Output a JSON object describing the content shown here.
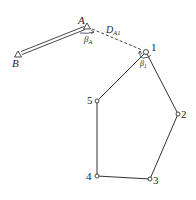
{
  "diagram": {
    "type": "traverse-survey-connection",
    "points": {
      "A": {
        "label": "A",
        "x": 87,
        "y": 27,
        "kind": "control"
      },
      "B": {
        "label": "B",
        "x": 18,
        "y": 54,
        "kind": "control"
      },
      "P1": {
        "label": "1",
        "x": 146,
        "y": 52,
        "kind": "traverse"
      },
      "P2": {
        "label": "2",
        "x": 178,
        "y": 114,
        "kind": "traverse"
      },
      "P3": {
        "label": "3",
        "x": 150,
        "y": 179,
        "kind": "traverse"
      },
      "P4": {
        "label": "4",
        "x": 97,
        "y": 176,
        "kind": "traverse"
      },
      "P5": {
        "label": "5",
        "x": 97,
        "y": 101,
        "kind": "traverse"
      }
    },
    "labels": {
      "A": "A",
      "B": "B",
      "p1": "1",
      "p2": "2",
      "p3": "3",
      "p4": "4",
      "p5": "5",
      "beta_A": "β",
      "beta_A_sub": "A",
      "beta_1": "β",
      "beta_1_sub": "1",
      "D": "D",
      "D_sub": "A1"
    },
    "edges": [
      {
        "from": "B",
        "to": "A",
        "style": "double-line"
      },
      {
        "from": "A",
        "to": "P1",
        "style": "dashed"
      },
      {
        "from": "P1",
        "to": "P2",
        "style": "solid"
      },
      {
        "from": "P2",
        "to": "P3",
        "style": "solid"
      },
      {
        "from": "P3",
        "to": "P4",
        "style": "solid"
      },
      {
        "from": "P4",
        "to": "P5",
        "style": "solid"
      },
      {
        "from": "P5",
        "to": "P1",
        "style": "solid"
      }
    ],
    "colors": {
      "line": "#333333",
      "background": "#ffffff"
    }
  }
}
